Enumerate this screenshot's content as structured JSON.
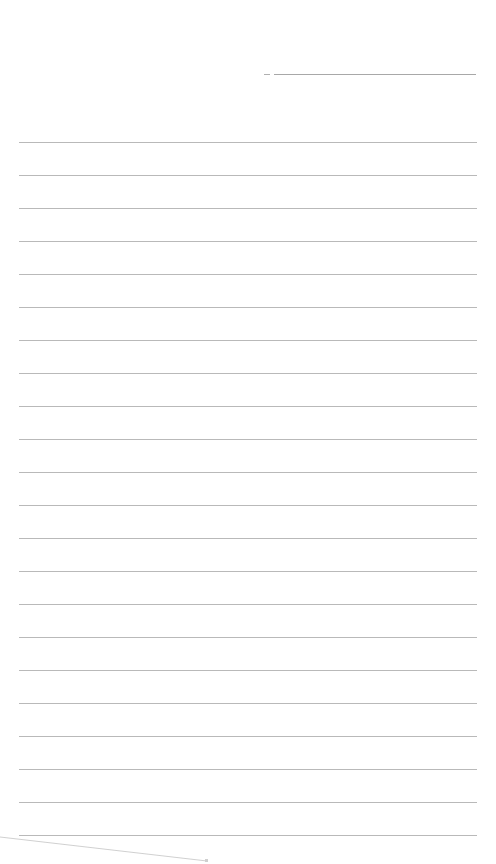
{
  "page": {
    "type": "blank ruled notebook page",
    "background": "#ffffff",
    "line_color": "#b9b9b9"
  },
  "header_line": {
    "dash": {
      "x1": 264,
      "x2": 270,
      "y": 74
    },
    "line": {
      "x1": 274,
      "x2": 476,
      "y": 74
    }
  },
  "ruled_lines": {
    "count": 22,
    "x1": 19,
    "x2": 477,
    "first_y": 142,
    "spacing": 33
  },
  "stray_mark": {
    "x1": 0,
    "y1": 837,
    "x2": 207,
    "y2": 861
  }
}
